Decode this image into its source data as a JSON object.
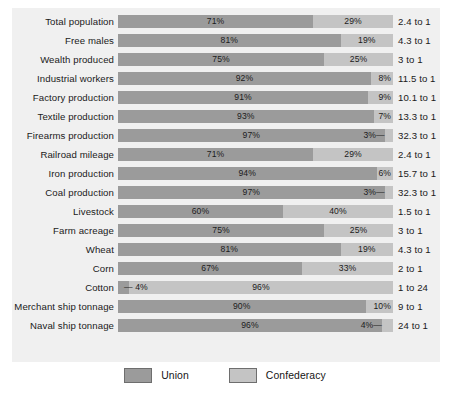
{
  "chart_data": {
    "type": "bar",
    "subtype": "stacked-horizontal-100-percent",
    "title": "",
    "xlabel": "",
    "ylabel": "",
    "xlim": [
      0,
      100
    ],
    "grid": false,
    "legend_position": "bottom-center",
    "categories": [
      "Total population",
      "Free males",
      "Wealth produced",
      "Industrial workers",
      "Factory production",
      "Textile production",
      "Firearms production",
      "Railroad mileage",
      "Iron production",
      "Coal production",
      "Livestock",
      "Farm acreage",
      "Wheat",
      "Corn",
      "Cotton",
      "Merchant ship tonnage",
      "Naval ship tonnage"
    ],
    "series": [
      {
        "name": "Union",
        "color": "#9b9b9b",
        "values": [
          71,
          81,
          75,
          92,
          91,
          93,
          97,
          71,
          94,
          97,
          60,
          75,
          81,
          67,
          4,
          90,
          96
        ]
      },
      {
        "name": "Confederacy",
        "color": "#c4c4c4",
        "values": [
          29,
          19,
          25,
          8,
          9,
          7,
          3,
          29,
          6,
          3,
          40,
          25,
          19,
          33,
          96,
          10,
          4
        ]
      }
    ],
    "ratios": [
      "2.4 to 1",
      "4.3 to 1",
      "3 to 1",
      "11.5 to 1",
      "10.1 to 1",
      "13.3 to 1",
      "32.3 to 1",
      "2.4 to 1",
      "15.7 to 1",
      "32.3 to 1",
      "1.5 to 1",
      "3 to 1",
      "4.3 to 1",
      "2 to 1",
      "1 to 24",
      "9 to 1",
      "24 to 1"
    ],
    "union_labels": [
      "71%",
      "81%",
      "75%",
      "92%",
      "91%",
      "93%",
      "97%",
      "71%",
      "94%",
      "97%",
      "60%",
      "75%",
      "81%",
      "67%",
      "— 4%",
      "90%",
      "96%"
    ],
    "conf_labels": [
      "29%",
      "19%",
      "25%",
      "8%",
      "9%",
      "7%",
      "3%—",
      "29%",
      "6%",
      "3%—",
      "40%",
      "25%",
      "19%",
      "33%",
      "96%",
      "10%",
      "4%—"
    ]
  },
  "rows": [
    {
      "label": "Total population",
      "union": 71,
      "conf": 29,
      "union_label": "71%",
      "conf_label": "29%",
      "ratio": "2.4 to 1",
      "union_label_outside": false,
      "conf_label_outside": false
    },
    {
      "label": "Free males",
      "union": 81,
      "conf": 19,
      "union_label": "81%",
      "conf_label": "19%",
      "ratio": "4.3 to 1",
      "union_label_outside": false,
      "conf_label_outside": false
    },
    {
      "label": "Wealth produced",
      "union": 75,
      "conf": 25,
      "union_label": "75%",
      "conf_label": "25%",
      "ratio": "3 to 1",
      "union_label_outside": false,
      "conf_label_outside": false
    },
    {
      "label": "Industrial workers",
      "union": 92,
      "conf": 8,
      "union_label": "92%",
      "conf_label": "8%",
      "ratio": "11.5 to 1",
      "union_label_outside": false,
      "conf_label_outside": false
    },
    {
      "label": "Factory production",
      "union": 91,
      "conf": 9,
      "union_label": "91%",
      "conf_label": "9%",
      "ratio": "10.1 to 1",
      "union_label_outside": false,
      "conf_label_outside": false
    },
    {
      "label": "Textile production",
      "union": 93,
      "conf": 7,
      "union_label": "93%",
      "conf_label": "7%",
      "ratio": "13.3 to 1",
      "union_label_outside": false,
      "conf_label_outside": false
    },
    {
      "label": "Firearms production",
      "union": 97,
      "conf": 3,
      "union_label": "97%",
      "conf_label": "3%—",
      "ratio": "32.3 to 1",
      "union_label_outside": false,
      "conf_label_outside": true
    },
    {
      "label": "Railroad mileage",
      "union": 71,
      "conf": 29,
      "union_label": "71%",
      "conf_label": "29%",
      "ratio": "2.4 to 1",
      "union_label_outside": false,
      "conf_label_outside": false
    },
    {
      "label": "Iron production",
      "union": 94,
      "conf": 6,
      "union_label": "94%",
      "conf_label": "6%",
      "ratio": "15.7 to 1",
      "union_label_outside": false,
      "conf_label_outside": false
    },
    {
      "label": "Coal production",
      "union": 97,
      "conf": 3,
      "union_label": "97%",
      "conf_label": "3%—",
      "ratio": "32.3 to 1",
      "union_label_outside": false,
      "conf_label_outside": true
    },
    {
      "label": "Livestock",
      "union": 60,
      "conf": 40,
      "union_label": "60%",
      "conf_label": "40%",
      "ratio": "1.5 to 1",
      "union_label_outside": false,
      "conf_label_outside": false
    },
    {
      "label": "Farm acreage",
      "union": 75,
      "conf": 25,
      "union_label": "75%",
      "conf_label": "25%",
      "ratio": "3 to 1",
      "union_label_outside": false,
      "conf_label_outside": false
    },
    {
      "label": "Wheat",
      "union": 81,
      "conf": 19,
      "union_label": "81%",
      "conf_label": "19%",
      "ratio": "4.3 to 1",
      "union_label_outside": false,
      "conf_label_outside": false
    },
    {
      "label": "Corn",
      "union": 67,
      "conf": 33,
      "union_label": "67%",
      "conf_label": "33%",
      "ratio": "2 to 1",
      "union_label_outside": false,
      "conf_label_outside": false
    },
    {
      "label": "Cotton",
      "union": 4,
      "conf": 96,
      "union_label": "— 4%",
      "conf_label": "96%",
      "ratio": "1 to 24",
      "union_label_outside": true,
      "conf_label_outside": false
    },
    {
      "label": "Merchant ship tonnage",
      "union": 90,
      "conf": 10,
      "union_label": "90%",
      "conf_label": "10%",
      "ratio": "9 to 1",
      "union_label_outside": false,
      "conf_label_outside": false
    },
    {
      "label": "Naval ship tonnage",
      "union": 96,
      "conf": 4,
      "union_label": "96%",
      "conf_label": "4%—",
      "ratio": "24 to 1",
      "union_label_outside": false,
      "conf_label_outside": true
    }
  ],
  "legend": {
    "items": [
      {
        "label": "Union",
        "color": "#9b9b9b",
        "key": "union"
      },
      {
        "label": "Confederacy",
        "color": "#c4c4c4",
        "key": "conf"
      }
    ]
  }
}
